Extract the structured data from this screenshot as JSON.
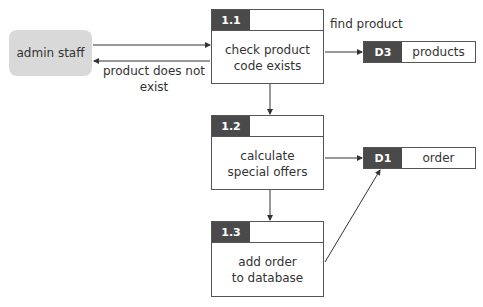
{
  "entity": {
    "label": "admin staff"
  },
  "processes": [
    {
      "id": "1.1",
      "label_line1": "check product",
      "label_line2": "code exists"
    },
    {
      "id": "1.2",
      "label_line1": "calculate",
      "label_line2": "special offers"
    },
    {
      "id": "1.3",
      "label_line1": "add order",
      "label_line2": "to database"
    }
  ],
  "stores": [
    {
      "id": "D3",
      "name": "products"
    },
    {
      "id": "D1",
      "name": "order"
    }
  ],
  "flows": {
    "find_product": "find product",
    "not_exist_line1": "product does not",
    "not_exist_line2": "exist"
  },
  "colors": {
    "header": "#4a4a4a",
    "entity": "#d9d9d9",
    "line": "#333333"
  }
}
